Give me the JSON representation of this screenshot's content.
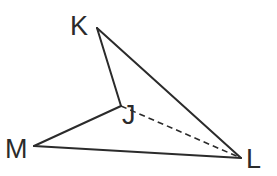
{
  "diagram": {
    "type": "geometry-figure",
    "vertices": {
      "K": {
        "label": "K",
        "x": 97,
        "y": 28,
        "label_x": 70,
        "label_y": 35
      },
      "J": {
        "label": "J",
        "x": 121,
        "y": 106,
        "label_x": 122,
        "label_y": 124
      },
      "M": {
        "label": "M",
        "x": 34,
        "y": 146,
        "label_x": 5,
        "label_y": 158
      },
      "L": {
        "label": "L",
        "x": 241,
        "y": 158,
        "label_x": 246,
        "label_y": 168
      }
    },
    "edges": [
      {
        "from": "K",
        "to": "J",
        "style": "solid"
      },
      {
        "from": "K",
        "to": "L",
        "style": "solid"
      },
      {
        "from": "J",
        "to": "M",
        "style": "solid"
      },
      {
        "from": "M",
        "to": "L",
        "style": "solid"
      },
      {
        "from": "J",
        "to": "L",
        "style": "dashed"
      }
    ],
    "colors": {
      "stroke": "#2b2b2b",
      "background": "#ffffff"
    }
  }
}
